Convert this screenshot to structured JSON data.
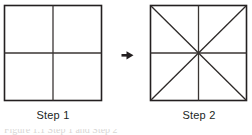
{
  "page": {
    "background_color": "#ffffff",
    "width": 252,
    "height": 135,
    "ink_color": "#231f20",
    "text_color": "#211f1e"
  },
  "figure": {
    "kind": "instructional-diagram",
    "arrow": {
      "direction": "right",
      "glyph": "arrow-right"
    },
    "panels": [
      {
        "id": "step-1",
        "label": "Step 1",
        "shape": "square",
        "region_count": 4,
        "lines": [
          "border",
          "vertical-midline",
          "horizontal-midline"
        ],
        "box": {
          "x": 4,
          "y": 5,
          "width": 98,
          "height": 96
        }
      },
      {
        "id": "step-2",
        "label": "Step 2",
        "shape": "square",
        "region_count": 8,
        "lines": [
          "border",
          "vertical-midline",
          "horizontal-midline",
          "diagonal-tl-br",
          "diagonal-tr-bl"
        ],
        "box": {
          "x": 150,
          "y": 5,
          "width": 97,
          "height": 96
        }
      }
    ]
  },
  "caption": {
    "clipped": true,
    "text": "Figure 1.1  Step 1 and Step 2"
  }
}
